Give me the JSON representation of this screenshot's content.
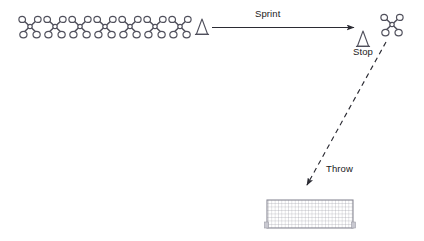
{
  "diagram": {
    "background_color": "#ffffff",
    "stroke_color": "#4d4d5a",
    "text_color": "#1a1a1a",
    "width": 424,
    "height": 241,
    "labels": {
      "sprint": "Sprint",
      "stop": "Stop",
      "throw": "Throw"
    },
    "athlete_queue": {
      "icon": "athlete-top-view-icon",
      "count": 7,
      "start_x": 30,
      "spacing": 25,
      "y": 27
    },
    "cones": [
      {
        "name": "start-cone",
        "icon": "cone-icon",
        "x": 202,
        "y": 27
      },
      {
        "name": "stop-cone",
        "icon": "cone-icon",
        "x": 363,
        "y": 39,
        "label": "Stop"
      }
    ],
    "thrower": {
      "name": "thrower-athlete",
      "icon": "athlete-top-view-icon",
      "x": 392,
      "y": 25
    },
    "arrows": [
      {
        "name": "sprint-arrow",
        "label": "Sprint",
        "style": "solid",
        "x1": 212,
        "y1": 27,
        "x2": 356,
        "y2": 27
      },
      {
        "name": "throw-arrow",
        "label": "Throw",
        "style": "dashed",
        "x1": 386,
        "y1": 42,
        "x2": 306,
        "y2": 186
      }
    ],
    "target_net": {
      "name": "target-net",
      "x": 267,
      "y": 200,
      "width": 86,
      "height": 28,
      "grid_cols": 26,
      "grid_rows": 8
    }
  }
}
